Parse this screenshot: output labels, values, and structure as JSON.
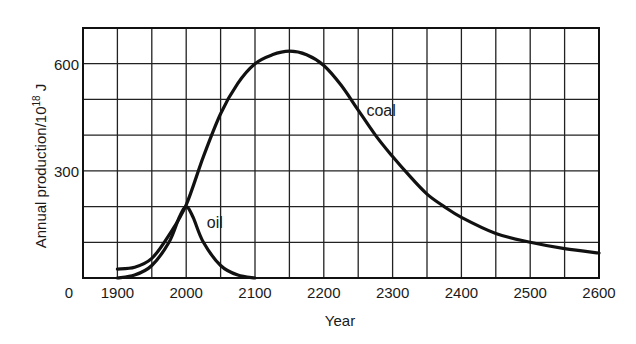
{
  "chart_data": {
    "type": "line",
    "title": "",
    "xlabel": "Year",
    "ylabel": "Annual production/10^18 J",
    "ylabel_display": {
      "prefix": "Annual production/10",
      "exponent": "18",
      "suffix": " J"
    },
    "xlim": [
      1850,
      2600
    ],
    "ylim": [
      0,
      700
    ],
    "grid": true,
    "grid_x_step": 50,
    "grid_y_step": 100,
    "x_ticks": [
      {
        "value": 1900,
        "label": "1900"
      },
      {
        "value": 2000,
        "label": "2000"
      },
      {
        "value": 2100,
        "label": "2100"
      },
      {
        "value": 2200,
        "label": "2200"
      },
      {
        "value": 2300,
        "label": "2300"
      },
      {
        "value": 2400,
        "label": "2400"
      },
      {
        "value": 2500,
        "label": "2500"
      },
      {
        "value": 2600,
        "label": "2600"
      }
    ],
    "y_ticks": [
      {
        "value": 300,
        "label": "300"
      },
      {
        "value": 600,
        "label": "600"
      }
    ],
    "origin_label": "0",
    "legend": "none (inline curve labels)",
    "series": [
      {
        "name": "coal",
        "label_pos": {
          "x": 2262,
          "y": 455
        },
        "x": [
          1900,
          1925,
          1950,
          1975,
          2000,
          2025,
          2050,
          2075,
          2100,
          2125,
          2150,
          2175,
          2200,
          2225,
          2250,
          2275,
          2300,
          2325,
          2350,
          2375,
          2400,
          2450,
          2500,
          2550,
          2600
        ],
        "values": [
          25,
          30,
          55,
          120,
          205,
          340,
          460,
          545,
          600,
          625,
          635,
          625,
          595,
          540,
          470,
          400,
          340,
          285,
          235,
          200,
          170,
          125,
          100,
          82,
          70
        ]
      },
      {
        "name": "oil",
        "label_pos": {
          "x": 2030,
          "y": 140
        },
        "x": [
          1900,
          1925,
          1950,
          1975,
          1990,
          2000,
          2010,
          2025,
          2050,
          2075,
          2100
        ],
        "values": [
          0,
          8,
          35,
          100,
          170,
          200,
          170,
          100,
          35,
          8,
          0
        ]
      }
    ]
  }
}
